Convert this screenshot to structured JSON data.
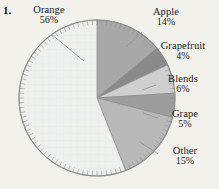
{
  "figure": {
    "item_number": "1.",
    "background_color": "#f3f1ec",
    "outline_color": "#8d8d8d"
  },
  "chart_data": {
    "type": "pie",
    "title": "",
    "subtitle": "",
    "xlabel": "",
    "ylabel": "",
    "legend_position": "callout-labels",
    "grid": false,
    "start_angle_deg": 0,
    "direction": "clockwise",
    "center": {
      "x": 97,
      "y": 98
    },
    "radius": 78,
    "categories": [
      "Apple",
      "Grapefruit",
      "Blends",
      "Grape",
      "Other",
      "Orange"
    ],
    "values": [
      14,
      4,
      6,
      5,
      15,
      56
    ],
    "value_suffix": "%",
    "colors": [
      "#a8a8a8",
      "#8a8a8a",
      "#cfcfcf",
      "#9d9d9d",
      "#b9b9b9",
      "#eef0ee"
    ],
    "slices": [
      {
        "label": "Apple",
        "value": 14,
        "value_text": "14%",
        "color": "#a8a8a8"
      },
      {
        "label": "Grapefruit",
        "value": 4,
        "value_text": "4%",
        "color": "#8a8a8a"
      },
      {
        "label": "Blends",
        "value": 6,
        "value_text": "6%",
        "color": "#cfcfcf"
      },
      {
        "label": "Grape",
        "value": 5,
        "value_text": "5%",
        "color": "#9d9d9d"
      },
      {
        "label": "Other",
        "value": 15,
        "value_text": "15%",
        "color": "#b9b9b9"
      },
      {
        "label": "Orange",
        "value": 56,
        "value_text": "56%",
        "color": "#eef0ee"
      }
    ]
  },
  "labels": {
    "orange": {
      "name": "Orange",
      "pct": "56%"
    },
    "apple": {
      "name": "Apple",
      "pct": "14%"
    },
    "grapefruit": {
      "name": "Grapefruit",
      "pct": "4%"
    },
    "blends": {
      "name": "Blends",
      "pct": "6%"
    },
    "grape": {
      "name": "Grape",
      "pct": "5%"
    },
    "other": {
      "name": "Other",
      "pct": "15%"
    }
  }
}
